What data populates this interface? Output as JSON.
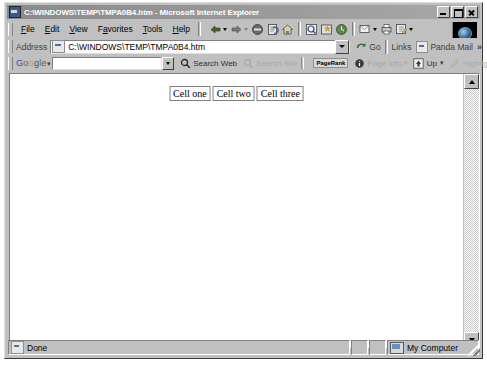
{
  "window": {
    "title": "C:\\WINDOWS\\TEMP\\TMPA0B4.htm - Microsoft Internet Explorer",
    "icon": "ie-document-icon",
    "controls": [
      {
        "name": "minimize-button",
        "label": "_"
      },
      {
        "name": "maximize-button",
        "label": "□"
      },
      {
        "name": "close-button",
        "label": "✕"
      }
    ]
  },
  "menu": {
    "items": [
      {
        "label": "File",
        "accel": "F"
      },
      {
        "label": "Edit",
        "accel": "E"
      },
      {
        "label": "View",
        "accel": "V"
      },
      {
        "label": "Favorites",
        "accel": "a"
      },
      {
        "label": "Tools",
        "accel": "T"
      },
      {
        "label": "Help",
        "accel": "H"
      }
    ]
  },
  "toolbar": {
    "buttons": [
      {
        "name": "back-button",
        "icon": "arrow-left-icon",
        "has_dropdown": true
      },
      {
        "name": "forward-button",
        "icon": "arrow-right-icon",
        "has_dropdown": true
      },
      {
        "name": "stop-button",
        "icon": "stop-icon"
      },
      {
        "name": "refresh-button",
        "icon": "refresh-icon"
      },
      {
        "name": "home-button",
        "icon": "home-icon"
      },
      {
        "name": "search-button",
        "icon": "search-icon"
      },
      {
        "name": "favorites-button",
        "icon": "favorites-icon"
      },
      {
        "name": "history-button",
        "icon": "history-icon"
      },
      {
        "name": "mail-button",
        "icon": "mail-icon",
        "has_dropdown": true
      },
      {
        "name": "print-button",
        "icon": "printer-icon"
      },
      {
        "name": "edit-button",
        "icon": "edit-icon",
        "has_dropdown": true
      }
    ],
    "animation_icon": "ie-globe-icon"
  },
  "address_bar": {
    "label": "Address",
    "value": "C:\\WINDOWS\\TEMP\\TMPA0B4.htm",
    "placeholder": "",
    "favicon": "page-icon",
    "go_label": "Go",
    "go_icon": "go-arrow-icon",
    "links_label": "Links",
    "links": [
      {
        "label": "Panda Mail",
        "icon": "page-icon"
      }
    ],
    "overflow_label": "»"
  },
  "google_toolbar": {
    "logo": [
      "G",
      "o",
      "o",
      "g",
      "l",
      "e"
    ],
    "logo_dropdown": "▾",
    "search_value": "",
    "search_placeholder": "",
    "buttons": [
      {
        "name": "search-web-button",
        "label": "Search Web",
        "icon": "google-magnifier-icon",
        "disabled": false
      },
      {
        "name": "search-site-button",
        "label": "Search Site",
        "icon": "google-site-icon",
        "disabled": true
      },
      {
        "name": "pagerank-indicator",
        "label": "PageRank",
        "icon": "pagerank-icon",
        "disabled": false
      },
      {
        "name": "page-info-button",
        "label": "Page Info",
        "icon": "info-icon",
        "disabled": true,
        "has_dropdown": true
      },
      {
        "name": "up-button",
        "label": "Up",
        "icon": "up-arrow-icon",
        "disabled": false,
        "has_dropdown": true
      },
      {
        "name": "highlight-button",
        "label": "Highlight",
        "icon": "highlighter-icon",
        "disabled": true
      }
    ]
  },
  "page": {
    "table": {
      "rows": [
        [
          "Cell one",
          "Cell two",
          "Cell three"
        ]
      ]
    },
    "background_color": "#ffffff"
  },
  "scrollbar": {
    "up_icon": "scroll-up-arrow-icon",
    "down_icon": "scroll-down-arrow-icon"
  },
  "status_bar": {
    "message": "Done",
    "message_icon": "page-icon",
    "zone": "My Computer",
    "zone_icon": "my-computer-icon"
  }
}
